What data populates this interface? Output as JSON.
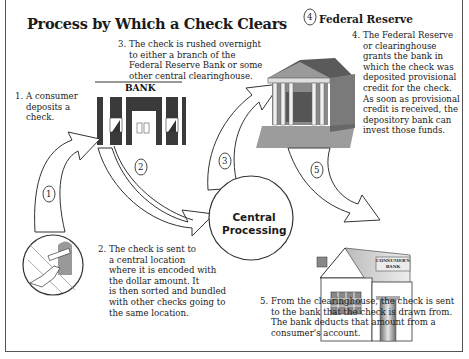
{
  "title": "Process by Which a Check Clears",
  "steps": [
    {
      "number": "1.",
      "lines": [
        "A consumer",
        "deposits a",
        "check."
      ]
    },
    {
      "number": "2.",
      "lines": [
        "The check is sent to",
        "a central location",
        "where it is encoded with",
        "the dollar amount. It",
        "is then sorted and bundled",
        "with other checks going to",
        "the same location."
      ]
    },
    {
      "number": "3.",
      "lines": [
        "The check is rushed overnight",
        "to either a branch of the",
        "Federal Reserve Bank or some",
        "other central clearinghouse."
      ]
    },
    {
      "number": "4.",
      "lines": [
        "The Federal Reserve",
        "or clearinghouse",
        "grants the bank in",
        "which the check was",
        "deposited provisional",
        "credit for the check.",
        "As soon as provisional",
        "credit is received, the",
        "depository bank can",
        "invest those funds."
      ]
    },
    {
      "number": "5.",
      "lines": [
        "From the clearinghouse, the check is sent",
        "to the bank that the check is drawn from.",
        "The bank deducts that amount from a",
        "consumer's account."
      ]
    }
  ],
  "labels": {
    "bank": "BANK",
    "central_processing_line1": "Central",
    "central_processing_line2": "Processing",
    "federal_reserve": "Federal Reserve",
    "federal_reserve_step": "4",
    "consumers_bank_line1": "CONSUMER'S",
    "consumers_bank_line2": "BANK"
  },
  "arrow_markers": [
    "1",
    "2",
    "3",
    "5"
  ],
  "colors": {
    "frame": "#555555",
    "ink": "#222222",
    "building_dark": "#3a3a3a",
    "building_mid": "#8a8a8a",
    "building_light": "#d8d8d8"
  }
}
